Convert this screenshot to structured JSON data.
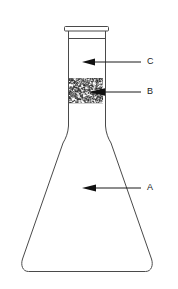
{
  "figure": {
    "background_color": "#ffffff",
    "outline_color": "#4a4a4a",
    "label_color": "#1a1a1a",
    "granule_color": "#2b2b2b",
    "arrow_color": "#111111"
  },
  "apparatus": {
    "name": "conical-flask",
    "parts": {
      "rim": "rim",
      "neck": "neck",
      "granular_layer": "granular-layer",
      "body": "conical-body",
      "base": "base"
    }
  },
  "callouts": [
    {
      "id": "callout-c",
      "label": "C",
      "target": "neck",
      "label_x": 149,
      "label_y": 62,
      "line_x1": 141,
      "line_x2": 94,
      "line_y": 62,
      "arrow_tip_x": 82,
      "arrow_tail_x": 94
    },
    {
      "id": "callout-b",
      "label": "B",
      "target": "granular-layer",
      "label_x": 149,
      "label_y": 92,
      "line_x1": 141,
      "line_x2": 104,
      "line_y": 92,
      "arrow_tip_x": 88,
      "arrow_tail_x": 104
    },
    {
      "id": "callout-a",
      "label": "A",
      "target": "conical-body",
      "label_x": 149,
      "label_y": 188,
      "line_x1": 141,
      "line_x2": 95,
      "line_y": 188,
      "arrow_tip_x": 82,
      "arrow_tail_x": 95
    }
  ],
  "geometry": {
    "rim": {
      "x": 64,
      "y": 26,
      "width": 44,
      "height": 5
    },
    "neck": {
      "left": 68,
      "right": 104,
      "top": 31,
      "bottom": 130
    },
    "neck_ring_y": 38,
    "granular_layer": {
      "top": 78,
      "bottom": 103,
      "left": 69,
      "right": 103
    },
    "base": {
      "left": 16,
      "right": 158,
      "y": 272
    }
  }
}
